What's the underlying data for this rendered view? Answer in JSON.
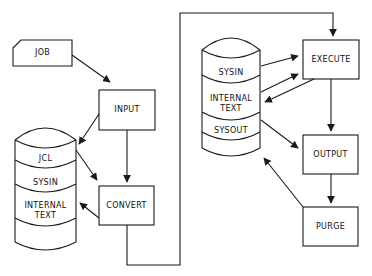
{
  "diagram": {
    "type": "flowchart",
    "stroke_color": "#1a1a1a",
    "background": "#ffffff",
    "nodes": {
      "job": {
        "label": "JOB",
        "shape": "card"
      },
      "input": {
        "label": "INPUT",
        "shape": "box"
      },
      "convert": {
        "label": "CONVERT",
        "shape": "box"
      },
      "execute": {
        "label": "EXECUTE",
        "shape": "box"
      },
      "output": {
        "label": "OUTPUT",
        "shape": "box"
      },
      "purge": {
        "label": "PURGE",
        "shape": "box"
      }
    },
    "left_store": {
      "shape": "cylinder",
      "sections": [
        "JCL",
        "SYSIN",
        "INTERNAL TEXT"
      ]
    },
    "right_store": {
      "shape": "cylinder",
      "sections": [
        "SYSIN",
        "INTERNAL TEXT",
        "SYSOUT"
      ]
    },
    "edges": [
      {
        "from": "job",
        "to": "input"
      },
      {
        "from": "input",
        "to": "left_store.JCL"
      },
      {
        "from": "input",
        "to": "convert"
      },
      {
        "from": "left_store.JCL",
        "to": "convert"
      },
      {
        "from": "convert",
        "to": "left_store.INTERNAL TEXT"
      },
      {
        "from": "convert",
        "to": "execute"
      },
      {
        "from": "right_store.SYSIN",
        "to": "execute"
      },
      {
        "from": "right_store.INTERNAL TEXT",
        "to": "execute"
      },
      {
        "from": "execute",
        "to": "right_store.INTERNAL TEXT"
      },
      {
        "from": "execute",
        "to": "output"
      },
      {
        "from": "right_store.SYSOUT",
        "to": "output"
      },
      {
        "from": "output",
        "to": "purge"
      },
      {
        "from": "purge",
        "to": "right_store"
      }
    ]
  }
}
